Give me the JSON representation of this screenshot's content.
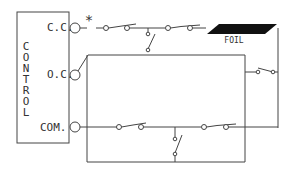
{
  "diagram": {
    "control_box": {
      "label_letters": [
        "C",
        "O",
        "N",
        "T",
        "R",
        "O",
        "L"
      ],
      "terminals": [
        {
          "id": "cc",
          "label": "C.C."
        },
        {
          "id": "oc",
          "label": "O.C."
        },
        {
          "id": "com",
          "label": "COM."
        }
      ]
    },
    "asterisk": "*",
    "foil_label": "FOIL",
    "colors": {
      "line": "#444444",
      "foil": "#111111",
      "background": "#ffffff"
    }
  }
}
